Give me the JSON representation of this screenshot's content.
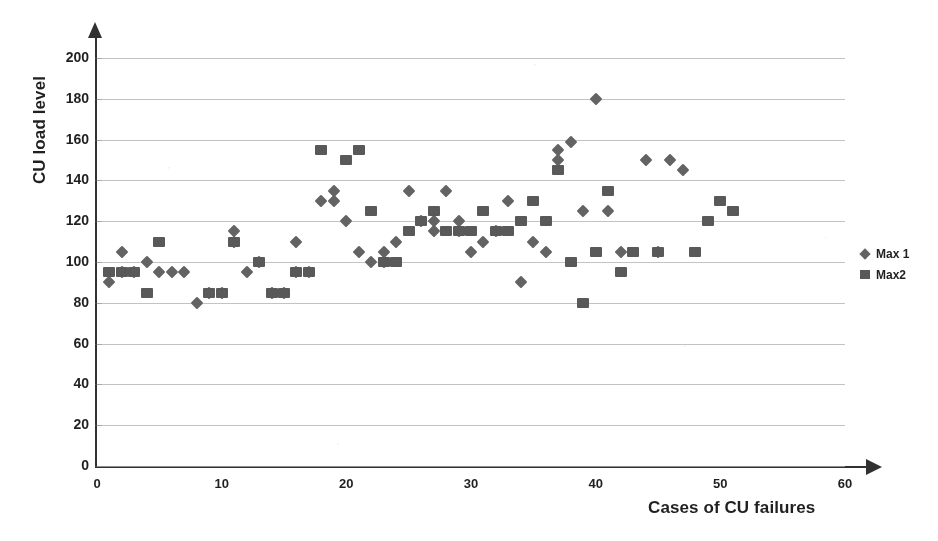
{
  "chart_data": {
    "type": "scatter",
    "title": "",
    "xlabel": "Cases of CU failures",
    "ylabel": "CU load level",
    "xlim": [
      0,
      60
    ],
    "ylim": [
      0,
      200
    ],
    "xticks": [
      0,
      10,
      20,
      30,
      40,
      50,
      60
    ],
    "yticks": [
      0,
      20,
      40,
      60,
      80,
      100,
      120,
      140,
      160,
      180,
      200
    ],
    "grid": "horizontal",
    "legend_position": "right",
    "marker_color": "#5a5a5a",
    "gridline_color": "#b9b9b9",
    "axis_color": "#2e2e2e",
    "series": [
      {
        "name": "Max 1",
        "marker": "diamond",
        "points": [
          [
            1,
            90
          ],
          [
            2,
            105
          ],
          [
            2,
            95
          ],
          [
            3,
            95
          ],
          [
            4,
            100
          ],
          [
            5,
            95
          ],
          [
            6,
            95
          ],
          [
            7,
            95
          ],
          [
            8,
            80
          ],
          [
            9,
            85
          ],
          [
            10,
            85
          ],
          [
            11,
            115
          ],
          [
            11,
            110
          ],
          [
            12,
            95
          ],
          [
            13,
            100
          ],
          [
            14,
            85
          ],
          [
            15,
            85
          ],
          [
            16,
            95
          ],
          [
            16,
            110
          ],
          [
            17,
            95
          ],
          [
            18,
            130
          ],
          [
            19,
            135
          ],
          [
            19,
            130
          ],
          [
            20,
            120
          ],
          [
            21,
            105
          ],
          [
            22,
            100
          ],
          [
            23,
            105
          ],
          [
            23,
            100
          ],
          [
            24,
            110
          ],
          [
            25,
            135
          ],
          [
            26,
            120
          ],
          [
            27,
            115
          ],
          [
            27,
            120
          ],
          [
            28,
            135
          ],
          [
            29,
            120
          ],
          [
            29,
            115
          ],
          [
            30,
            105
          ],
          [
            31,
            110
          ],
          [
            32,
            115
          ],
          [
            33,
            130
          ],
          [
            34,
            90
          ],
          [
            35,
            110
          ],
          [
            36,
            105
          ],
          [
            37,
            150
          ],
          [
            37,
            155
          ],
          [
            38,
            159
          ],
          [
            39,
            125
          ],
          [
            40,
            180
          ],
          [
            41,
            125
          ],
          [
            42,
            105
          ],
          [
            44,
            150
          ],
          [
            45,
            105
          ],
          [
            46,
            150
          ],
          [
            47,
            145
          ]
        ]
      },
      {
        "name": "Max2",
        "marker": "square",
        "points": [
          [
            1,
            95
          ],
          [
            2,
            95
          ],
          [
            3,
            95
          ],
          [
            4,
            85
          ],
          [
            5,
            110
          ],
          [
            9,
            85
          ],
          [
            10,
            85
          ],
          [
            11,
            110
          ],
          [
            13,
            100
          ],
          [
            14,
            85
          ],
          [
            15,
            85
          ],
          [
            16,
            95
          ],
          [
            17,
            95
          ],
          [
            18,
            155
          ],
          [
            20,
            150
          ],
          [
            21,
            155
          ],
          [
            22,
            125
          ],
          [
            23,
            100
          ],
          [
            24,
            100
          ],
          [
            25,
            115
          ],
          [
            26,
            120
          ],
          [
            27,
            125
          ],
          [
            28,
            115
          ],
          [
            29,
            115
          ],
          [
            30,
            115
          ],
          [
            31,
            125
          ],
          [
            32,
            115
          ],
          [
            33,
            115
          ],
          [
            34,
            120
          ],
          [
            35,
            130
          ],
          [
            36,
            120
          ],
          [
            37,
            145
          ],
          [
            38,
            100
          ],
          [
            39,
            80
          ],
          [
            40,
            105
          ],
          [
            41,
            135
          ],
          [
            42,
            95
          ],
          [
            43,
            105
          ],
          [
            45,
            105
          ],
          [
            48,
            105
          ],
          [
            49,
            120
          ],
          [
            50,
            130
          ],
          [
            51,
            125
          ]
        ]
      }
    ]
  },
  "legend": {
    "items": [
      {
        "label": "Max 1",
        "marker": "diamond"
      },
      {
        "label": "Max2",
        "marker": "square"
      }
    ]
  }
}
